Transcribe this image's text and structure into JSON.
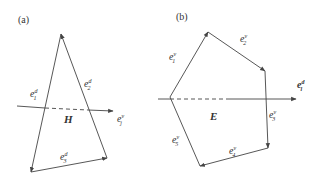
{
  "panels": [
    {
      "tag": "(a)",
      "region_label": "H",
      "edges": [
        {
          "base": "e",
          "sup": "d",
          "sub": "1"
        },
        {
          "base": "e",
          "sup": "d",
          "sub": "2"
        },
        {
          "base": "e",
          "sup": "d",
          "sub": "3"
        }
      ],
      "crossing_edge": {
        "base": "e",
        "sup": "v",
        "sub": "j"
      }
    },
    {
      "tag": "(b)",
      "region_label": "E",
      "edges": [
        {
          "base": "e",
          "sup": "v",
          "sub": "1"
        },
        {
          "base": "e",
          "sup": "v",
          "sub": "2"
        },
        {
          "base": "e",
          "sup": "v",
          "sub": "3"
        },
        {
          "base": "e",
          "sup": "v",
          "sub": "4"
        },
        {
          "base": "e",
          "sup": "v",
          "sub": "5"
        }
      ],
      "crossing_edge": {
        "base": "e",
        "sup": "d",
        "sub": "l"
      }
    }
  ],
  "colors": {
    "line": "#444444",
    "text": "#333333"
  }
}
